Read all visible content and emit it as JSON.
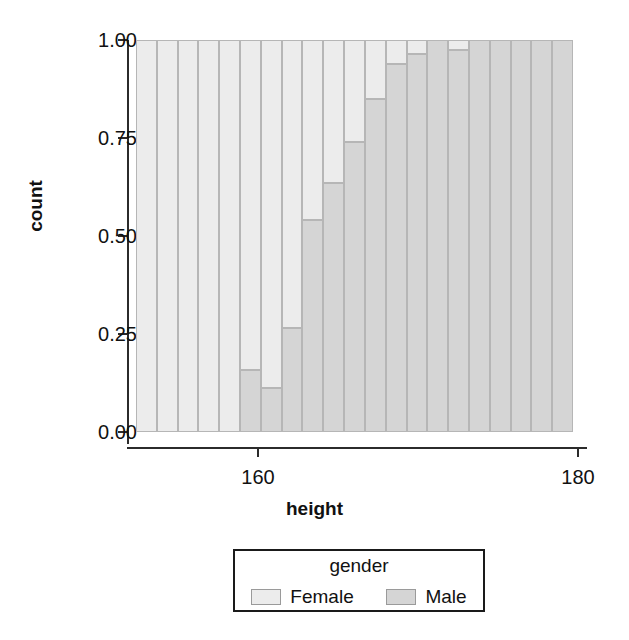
{
  "chart_data": {
    "type": "bar",
    "subtype": "stacked-proportional-histogram",
    "title": "",
    "xlabel": "height",
    "ylabel": "count",
    "xlim": [
      152.4,
      179.7
    ],
    "ylim": [
      0.0,
      1.0
    ],
    "grid": false,
    "legend": {
      "title": "gender",
      "position": "bottom-center",
      "entries": [
        {
          "name": "Female",
          "color": "#ececec"
        },
        {
          "name": "Male",
          "color": "#d5d5d5"
        }
      ]
    },
    "xticks": [
      160,
      180,
      200
    ],
    "xtick_labels": [
      "160",
      "180",
      "200"
    ],
    "yticks": [
      0.0,
      0.25,
      0.5,
      0.75,
      1.0
    ],
    "ytick_labels": [
      "0.00",
      "0.25",
      "0.50",
      "0.75",
      "1.00"
    ],
    "bin_width": 2.2,
    "bin_starts": [
      144.4,
      146.6,
      148.8,
      151.0,
      153.2,
      155.4,
      157.6,
      159.8,
      162.0,
      164.2,
      166.4,
      168.6,
      170.8,
      173.0,
      175.2,
      177.4,
      179.6,
      181.8,
      184.0,
      186.2,
      188.4
    ],
    "categories": [
      "145.5",
      "147.7",
      "149.9",
      "152.1",
      "154.3",
      "156.5",
      "158.7",
      "160.9",
      "163.1",
      "165.3",
      "167.5",
      "169.7",
      "171.9",
      "174.1",
      "176.3",
      "178.5",
      "180.7",
      "182.9",
      "185.1",
      "187.3",
      "189.5"
    ],
    "series": [
      {
        "name": "Male",
        "values": [
          0.0,
          0.0,
          0.0,
          0.0,
          0.0,
          0.158,
          0.112,
          0.265,
          0.54,
          0.635,
          0.74,
          0.85,
          0.94,
          0.965,
          1.0,
          0.975,
          1.0,
          1.0,
          1.0,
          1.0,
          1.0
        ]
      },
      {
        "name": "Female",
        "values": [
          1.0,
          1.0,
          1.0,
          1.0,
          1.0,
          0.842,
          0.888,
          0.735,
          0.46,
          0.365,
          0.26,
          0.15,
          0.06,
          0.035,
          0.0,
          0.025,
          0.0,
          0.0,
          0.0,
          0.0,
          0.0
        ]
      }
    ]
  },
  "axes": {
    "ylabel": "count",
    "xlabel": "height"
  },
  "colors": {
    "female": "#ececec",
    "male": "#d5d5d5",
    "bar_border": "#b6b6b6",
    "axis": "#2b2b2b",
    "text": "#111111"
  }
}
